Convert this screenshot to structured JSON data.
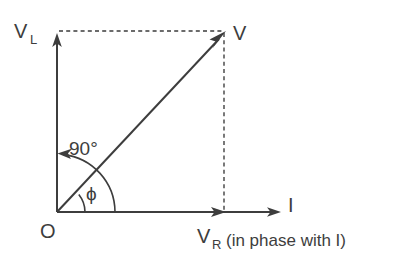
{
  "diagram": {
    "background_color": "#ffffff",
    "line_color": "#3d3d3d",
    "dashed_color": "#6b6b6b",
    "labels": {
      "origin": "O",
      "v_axis_main": "V",
      "v_axis_sub": "L",
      "resultant": "V",
      "current": "I",
      "resistive_main": "V",
      "resistive_sub": "R",
      "phase_note": "(in phase with I)",
      "right_angle": "90°",
      "phase_angle": "ϕ"
    },
    "geometry": {
      "origin_x": 57,
      "origin_y": 212,
      "v_axis_tip_y": 36,
      "i_axis_tip_x": 280,
      "vr_arrow_x": 224,
      "resultant_tip_x": 224,
      "resultant_tip_y": 33,
      "right_angle_arc_radius": 58,
      "phase_arc_radius": 28
    }
  }
}
